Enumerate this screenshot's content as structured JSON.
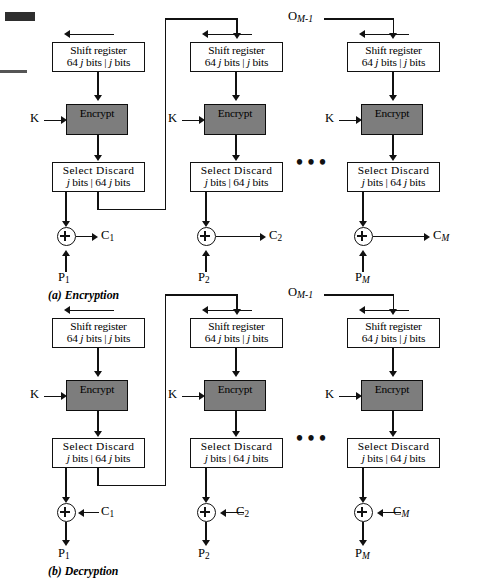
{
  "figure": {
    "gray_fill": "#7d7d7d",
    "line_color": "#111111"
  },
  "labels": {
    "shift_register_line1": "Shift register",
    "select_line1": "Select   Discard",
    "des_line1": "DES",
    "des_line2": "Encrypt",
    "key": "K",
    "ellipsis": "•••"
  },
  "sections": [
    {
      "id": "encryption",
      "caption": "(a) Encryption",
      "feedback_label": "O",
      "feedback_sub": "M-1",
      "stages": [
        {
          "id": "stage-1",
          "sr_bits_left": "64",
          "sr_bits_right": "bits",
          "cipher": "C",
          "cipher_sub": "1",
          "plain": "P",
          "plain_sub": "1"
        },
        {
          "id": "stage-2",
          "cipher": "C",
          "cipher_sub": "2",
          "plain": "P",
          "plain_sub": "2"
        },
        {
          "id": "stage-M",
          "cipher": "C",
          "cipher_sub": "M",
          "plain": "P",
          "plain_sub": "M"
        }
      ]
    },
    {
      "id": "decryption",
      "caption": "(b) Decryption",
      "feedback_label": "O",
      "feedback_sub": "M-1",
      "stages": [
        {
          "id": "stage-1",
          "cipher": "C",
          "cipher_sub": "1",
          "plain": "P",
          "plain_sub": "1"
        },
        {
          "id": "stage-2",
          "cipher": "C",
          "cipher_sub": "2",
          "plain": "P",
          "plain_sub": "2"
        },
        {
          "id": "stage-M",
          "cipher": "C",
          "cipher_sub": "M",
          "plain": "P",
          "plain_sub": "M"
        }
      ]
    }
  ],
  "box_text": {
    "sr_l1": "Shift register",
    "sr_l2_a": "64 ",
    "sr_l2_j1": "j",
    "sr_l2_b": " bits | ",
    "sr_l2_j2": "j",
    "sr_l2_c": " bits",
    "sel_l1": "Select   Discard",
    "sel_l2_j1": "j",
    "sel_l2_a": " bits | 64 ",
    "sel_l2_j2": "j",
    "sel_l2_b": " bits"
  }
}
